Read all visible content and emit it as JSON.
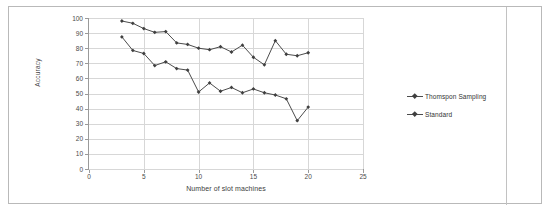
{
  "figure": {
    "frame_border_color": "#b9b9b9",
    "background": "#ffffff"
  },
  "chart_data": {
    "type": "line",
    "title": "",
    "xlabel": "Number of slot machines",
    "ylabel": "Accuracy",
    "xlim": [
      0,
      25
    ],
    "ylim": [
      0,
      100
    ],
    "xticks": [
      0,
      5,
      10,
      15,
      20,
      25
    ],
    "yticks": [
      0,
      10,
      20,
      30,
      40,
      50,
      60,
      70,
      80,
      90,
      100
    ],
    "grid": "horizontal-and-vertical",
    "legend_position": "right",
    "series_color": "#4c4c4c",
    "marker_color": "#3f3f3f",
    "x": [
      3,
      4,
      5,
      6,
      7,
      8,
      9,
      10,
      11,
      12,
      13,
      14,
      15,
      16,
      17,
      18,
      19,
      20
    ],
    "series": [
      {
        "name": "Thomspon Sampling",
        "values": [
          98,
          96.5,
          93,
          90.5,
          91,
          83.5,
          82.5,
          80,
          79,
          81,
          77.5,
          82,
          74,
          69,
          85,
          76,
          75,
          77
        ]
      },
      {
        "name": "Standard",
        "values": [
          87.5,
          78.5,
          76.5,
          68.5,
          71,
          66.5,
          65.5,
          51,
          57,
          51.5,
          54,
          50.5,
          53,
          50.5,
          49,
          46.5,
          32,
          41
        ]
      }
    ]
  },
  "legend": {
    "items": [
      {
        "label": "Thomspon Sampling"
      },
      {
        "label": "Standard"
      }
    ]
  }
}
